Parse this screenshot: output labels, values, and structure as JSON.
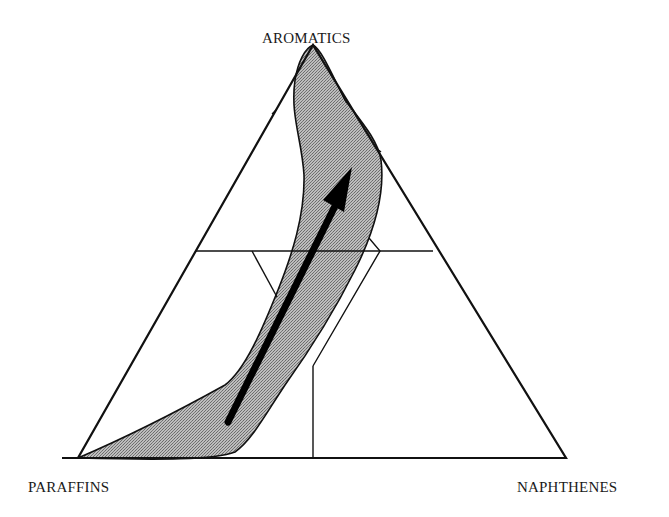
{
  "diagram": {
    "type": "ternary",
    "vertices": {
      "top": "AROMATICS",
      "bottom_left": "PARAFFINS",
      "bottom_right": "NAPHTHENES"
    },
    "regions": [
      {
        "name": "shaded-composition-field",
        "fill": "#a8a8a8",
        "pattern": "stippled"
      }
    ],
    "arrow": {
      "direction": "from PARAFFINS-rich toward AROMATICS",
      "color": "#000000"
    },
    "colors": {
      "outline": "#111111",
      "shading": "#a8a8a8",
      "background": "#ffffff"
    }
  }
}
